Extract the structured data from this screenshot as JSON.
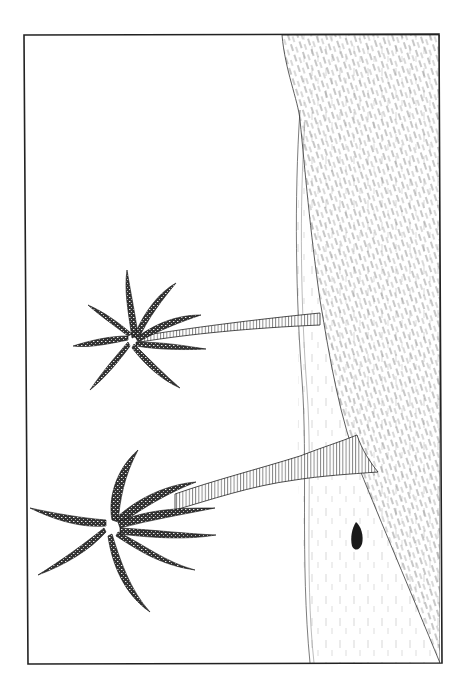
{
  "illustration": {
    "subject": "two palm trees on a beach",
    "style": "black ink line drawing, rotated 90 degrees",
    "colors": {
      "ink": "#1a1a1a",
      "paper": "#ffffff",
      "hatch": "#555555"
    },
    "frame": {
      "x": 24,
      "y": 35,
      "width": 416,
      "height": 628
    },
    "elements": [
      {
        "name": "sea-area",
        "description": "hatched water region on right"
      },
      {
        "name": "sand-beach",
        "description": "light strip between sea and sky"
      },
      {
        "name": "palm-tree-small",
        "description": "upper, thinner palm with 8 fronds"
      },
      {
        "name": "palm-tree-large",
        "description": "lower, thicker palm with 9 fronds"
      },
      {
        "name": "rock",
        "description": "small dark blob on the sand"
      }
    ]
  }
}
